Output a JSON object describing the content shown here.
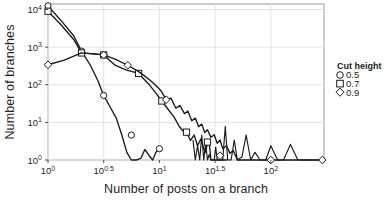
{
  "chart_data": {
    "type": "line",
    "title": "",
    "xlabel": "Number of posts on a branch",
    "ylabel": "Number of branches",
    "xscale": "log10",
    "yscale": "log10",
    "xlim": [
      1,
      300
    ],
    "ylim": [
      1,
      14000
    ],
    "grid": true,
    "xticks": [
      1,
      3.1623,
      10,
      31.623,
      100
    ],
    "xtick_labels": [
      "10^0",
      "10^0.5",
      "10^1",
      "10^1.5",
      "10^2"
    ],
    "yticks": [
      1,
      10,
      100,
      1000,
      10000
    ],
    "ytick_labels": [
      "10^0",
      "10^1",
      "10^2",
      "10^3",
      "10^4"
    ],
    "legend": {
      "title": "Cut height",
      "position": "right",
      "entries": [
        {
          "label": "0.5",
          "marker": "circle"
        },
        {
          "label": "0.7",
          "marker": "square"
        },
        {
          "label": "0.9",
          "marker": "diamond"
        }
      ]
    },
    "series": [
      {
        "name": "0.5",
        "marker": "circle",
        "marker_x": [
          1,
          2,
          3.16,
          5.6,
          10
        ],
        "marker_y": [
          12500,
          780,
          52,
          4.6,
          2
        ],
        "x": [
          1,
          1.3,
          1.7,
          2,
          2.4,
          2.8,
          3.16,
          3.6,
          4.1,
          4.6,
          5.1,
          5.6,
          6.2,
          6.8,
          7.4,
          8.1,
          8.7,
          9.3,
          10
        ],
        "y": [
          12500,
          5200,
          2000,
          780,
          330,
          130,
          52,
          26,
          13,
          4.6,
          1.6,
          1,
          1,
          1.1,
          1.9,
          1.3,
          1,
          1.6,
          2
        ]
      },
      {
        "name": "0.7",
        "marker": "square",
        "marker_x": [
          1,
          2,
          3.16,
          6.5,
          10.5,
          17.5,
          27
        ],
        "marker_y": [
          9000,
          700,
          620,
          200,
          37,
          5.5,
          3
        ],
        "x": [
          1,
          1.3,
          1.7,
          2,
          2.5,
          3.16,
          4,
          5,
          6.5,
          8,
          9.3,
          10.5,
          12,
          13.5,
          15,
          16.2,
          17.5,
          19,
          20.5,
          22,
          23.5,
          25,
          26,
          27,
          28,
          29,
          30,
          31,
          32,
          34,
          36,
          38,
          40
        ],
        "y": [
          9000,
          4000,
          1600,
          700,
          660,
          620,
          330,
          250,
          200,
          105,
          60,
          37,
          22,
          14,
          8,
          6,
          5.5,
          3.3,
          4.6,
          2.4,
          3.6,
          2,
          1.6,
          3,
          2.8,
          1,
          1,
          1,
          1,
          1,
          1,
          1,
          1
        ]
      },
      {
        "name": "0.9",
        "marker": "diamond",
        "marker_x": [
          1,
          3.16,
          5.2,
          11.5,
          35,
          100,
          290
        ],
        "marker_y": [
          340,
          620,
          330,
          40,
          1.3,
          1,
          1
        ],
        "x": [
          1,
          1.4,
          2,
          2.6,
          3.16,
          4,
          5.2,
          6.4,
          7.3,
          8.3,
          9.2,
          10.3,
          11.5,
          12.7,
          14,
          15.3,
          16.8,
          18,
          19.5,
          21,
          22.5,
          24,
          25.5,
          27,
          29,
          31,
          33,
          35,
          37,
          40,
          43,
          46,
          50,
          54,
          58,
          63,
          68,
          74,
          80,
          88,
          94,
          100,
          110,
          125,
          140,
          155,
          170,
          200,
          235,
          260,
          290
        ],
        "y": [
          340,
          450,
          700,
          660,
          620,
          480,
          330,
          230,
          175,
          130,
          98,
          70,
          40,
          44,
          24,
          28,
          17,
          20,
          11,
          13,
          7.6,
          9,
          5.4,
          6.4,
          4,
          4.7,
          2.8,
          3.4,
          2,
          2.4,
          1.5,
          1.8,
          1,
          1,
          1,
          1,
          1,
          1,
          1,
          1,
          1,
          1,
          1,
          1,
          1,
          1,
          1,
          1,
          1,
          1,
          1
        ]
      }
    ],
    "noise_tail": {
      "comment_x": [
        20,
        21,
        22,
        23,
        24,
        25,
        26,
        27,
        28,
        29,
        30,
        31,
        32,
        33,
        35,
        37,
        39,
        41,
        44,
        47,
        50,
        55,
        60,
        66,
        72,
        80,
        90,
        100,
        115,
        130,
        150,
        175,
        200,
        240,
        290
      ],
      "comment_y": [
        3.4,
        1,
        2.4,
        1,
        4.6,
        1,
        2.8,
        1,
        1.4,
        1,
        1,
        1,
        2.2,
        1,
        1,
        1,
        7.8,
        1,
        1,
        3.4,
        1,
        1.2,
        4.6,
        1,
        1.6,
        1,
        1,
        2.4,
        1,
        1,
        2.6,
        1,
        1,
        1,
        1
      ]
    }
  },
  "colors": {
    "line": "#1a1a1a",
    "marker_fill": "#ffffff",
    "grid": "#e3e3e3",
    "panel_border": "#999999",
    "background": "#ffffff"
  }
}
